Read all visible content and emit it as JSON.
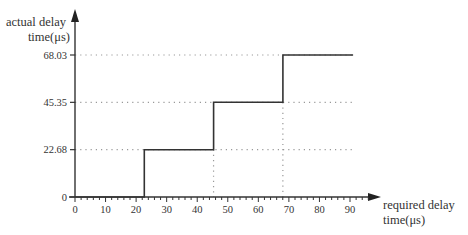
{
  "chart_data": {
    "type": "line",
    "subtype": "step",
    "title": "",
    "xlabel": [
      "required delay",
      "time(μs)"
    ],
    "ylabel": [
      "actual delay",
      "time(μs)"
    ],
    "xlim": [
      0,
      100
    ],
    "ylim": [
      0,
      75
    ],
    "x_ticks": [
      0,
      10,
      20,
      30,
      40,
      50,
      60,
      70,
      80,
      90
    ],
    "y_ticks": [
      0,
      22.68,
      45.35,
      68.03
    ],
    "y_tick_labels": [
      "0",
      "22.68",
      "45.35",
      "68.03"
    ],
    "grid": "dotted reference lines at y tick levels and x step edges",
    "series": [
      {
        "name": "actual delay",
        "points": [
          [
            0,
            0
          ],
          [
            22.68,
            0
          ],
          [
            22.68,
            22.68
          ],
          [
            45.35,
            22.68
          ],
          [
            45.35,
            45.35
          ],
          [
            68.03,
            45.35
          ],
          [
            68.03,
            68.03
          ],
          [
            91,
            68.03
          ]
        ]
      }
    ],
    "colors": {
      "axis": "#333333",
      "line": "#333333",
      "grid": "#999999"
    }
  }
}
